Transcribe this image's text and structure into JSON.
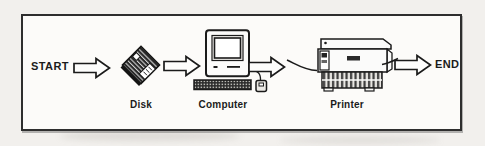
{
  "diagram": {
    "type": "flowchart",
    "labels": {
      "start": "START",
      "end": "END"
    },
    "nodes": [
      {
        "id": "disk",
        "label": "Disk"
      },
      {
        "id": "computer",
        "label": "Computer"
      },
      {
        "id": "printer",
        "label": "Printer"
      }
    ],
    "edges": [
      [
        "START",
        "Disk"
      ],
      [
        "Disk",
        "Computer"
      ],
      [
        "Computer",
        "Printer"
      ],
      [
        "Printer",
        "END"
      ]
    ],
    "icons": [
      "flow-arrow-icon",
      "floppy-disk-icon",
      "computer-icon",
      "printer-icon",
      "paper-line"
    ],
    "colors": {
      "ink": "#1b1b1b",
      "paper_bg": "#f2f0ed",
      "frame_bg": "#fcfbf9",
      "disk_face": "#262626"
    }
  }
}
